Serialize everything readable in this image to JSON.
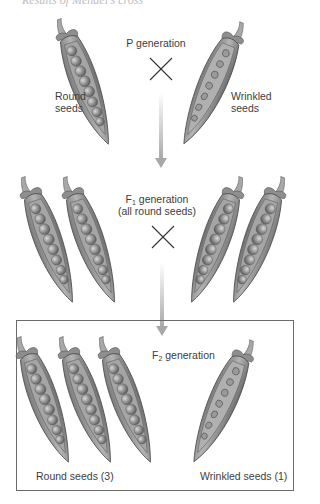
{
  "header": {
    "cut_text": "Results of Mendel's cross"
  },
  "p_generation": {
    "title": "P generation",
    "left_label": [
      "Round",
      "seeds"
    ],
    "right_label": [
      "Wrinkled",
      "seeds"
    ],
    "cross_symbol": "×"
  },
  "f1_generation": {
    "title_prefix": "F",
    "title_sub": "1",
    "title_suffix": " generation",
    "subtitle": "(all round seeds)",
    "cross_symbol": "×"
  },
  "f2_generation": {
    "title_prefix": "F",
    "title_sub": "2",
    "title_suffix": " generation",
    "left_label": "Round seeds (3)",
    "right_label": "Wrinkled seeds (1)"
  },
  "colors": {
    "pod_fill": "#9a9a9a",
    "pod_dark": "#5e5e5e",
    "pea": "#8c8c8c",
    "arrow": "#b0b0b0",
    "box_border": "#6a6a6a"
  }
}
